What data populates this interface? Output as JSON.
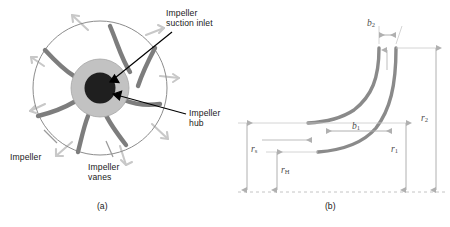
{
  "figure": {
    "type": "engineering-diagram",
    "panels": [
      {
        "id": "a",
        "caption": "(a)",
        "view": "front view of impeller with vanes and flow arrows",
        "callouts": [
          {
            "name": "impeller-suction-inlet",
            "text": "Impeller\nsuction inlet"
          },
          {
            "name": "impeller-hub",
            "text": "Impeller\nhub"
          },
          {
            "name": "impeller",
            "text": "Impeller"
          },
          {
            "name": "impeller-vanes",
            "text": "Impeller\nvanes"
          }
        ],
        "vane_count": 7,
        "flow_arrow_count": 8
      },
      {
        "id": "b",
        "caption": "(b)",
        "view": "meridional cross-section with radius and width dimensions",
        "dimensions": [
          {
            "name": "b2",
            "symbol": "b",
            "subscript": "2",
            "orientation": "horizontal",
            "meaning": "impeller outlet width"
          },
          {
            "name": "b1",
            "symbol": "b",
            "subscript": "1",
            "orientation": "horizontal",
            "meaning": "impeller inlet width"
          },
          {
            "name": "r2",
            "symbol": "r",
            "subscript": "2",
            "orientation": "vertical",
            "meaning": "impeller outlet radius"
          },
          {
            "name": "r1",
            "symbol": "r",
            "subscript": "1",
            "orientation": "vertical",
            "meaning": "impeller inlet radius"
          },
          {
            "name": "rs",
            "symbol": "r",
            "subscript": "s",
            "orientation": "vertical",
            "meaning": "suction radius"
          },
          {
            "name": "rH",
            "symbol": "r",
            "subscript": "H",
            "orientation": "vertical",
            "meaning": "hub radius"
          }
        ]
      }
    ]
  },
  "colors": {
    "hub_disc": "#c0c0c0",
    "suction_inlet": "#1a1a1a",
    "vane": "#808080",
    "flow_arrow": "#c8c8c8",
    "outline": "#808080",
    "dimension_line": "#b3b3b3",
    "profile_curve": "#808080",
    "text": "#1a1a1a"
  }
}
